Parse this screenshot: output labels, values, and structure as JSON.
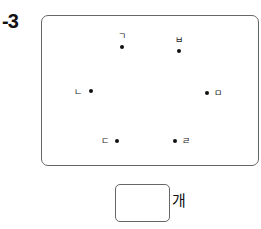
{
  "problem": {
    "number": "-3"
  },
  "points": [
    {
      "label": "ㄱ",
      "dot": [
        122,
        47
      ],
      "label_pos": [
        118,
        32
      ]
    },
    {
      "label": "ㅂ",
      "dot": [
        179,
        51
      ],
      "label_pos": [
        175,
        36
      ]
    },
    {
      "label": "ㄴ",
      "dot": [
        91,
        91
      ],
      "label_pos": [
        74,
        88
      ]
    },
    {
      "label": "ㅁ",
      "dot": [
        207,
        93
      ],
      "label_pos": [
        214,
        89
      ]
    },
    {
      "label": "ㄷ",
      "dot": [
        117,
        141
      ],
      "label_pos": [
        101,
        137
      ]
    },
    {
      "label": "ㄹ",
      "dot": [
        175,
        141
      ],
      "label_pos": [
        182,
        137
      ]
    }
  ],
  "answer": {
    "value": "",
    "unit": "개"
  }
}
